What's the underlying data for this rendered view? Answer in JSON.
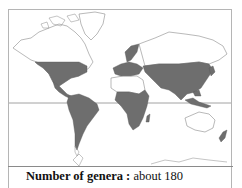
{
  "map": {
    "title": "Distribution map",
    "projection_lines": [
      "equator"
    ],
    "colors": {
      "land_outline": "#777777",
      "distribution_fill": "#6e6e6e",
      "background": "#ffffff",
      "equator": "#8a8a8a"
    },
    "distribution_regions": [
      "North America (southern half)",
      "Central America",
      "South America",
      "Europe",
      "Africa (excluding Sahara)",
      "Asia (temperate and tropical)",
      "Southeast Asia / Malesia",
      "New Zealand"
    ]
  },
  "caption": {
    "label": "Number of genera :",
    "value": "about 180"
  }
}
